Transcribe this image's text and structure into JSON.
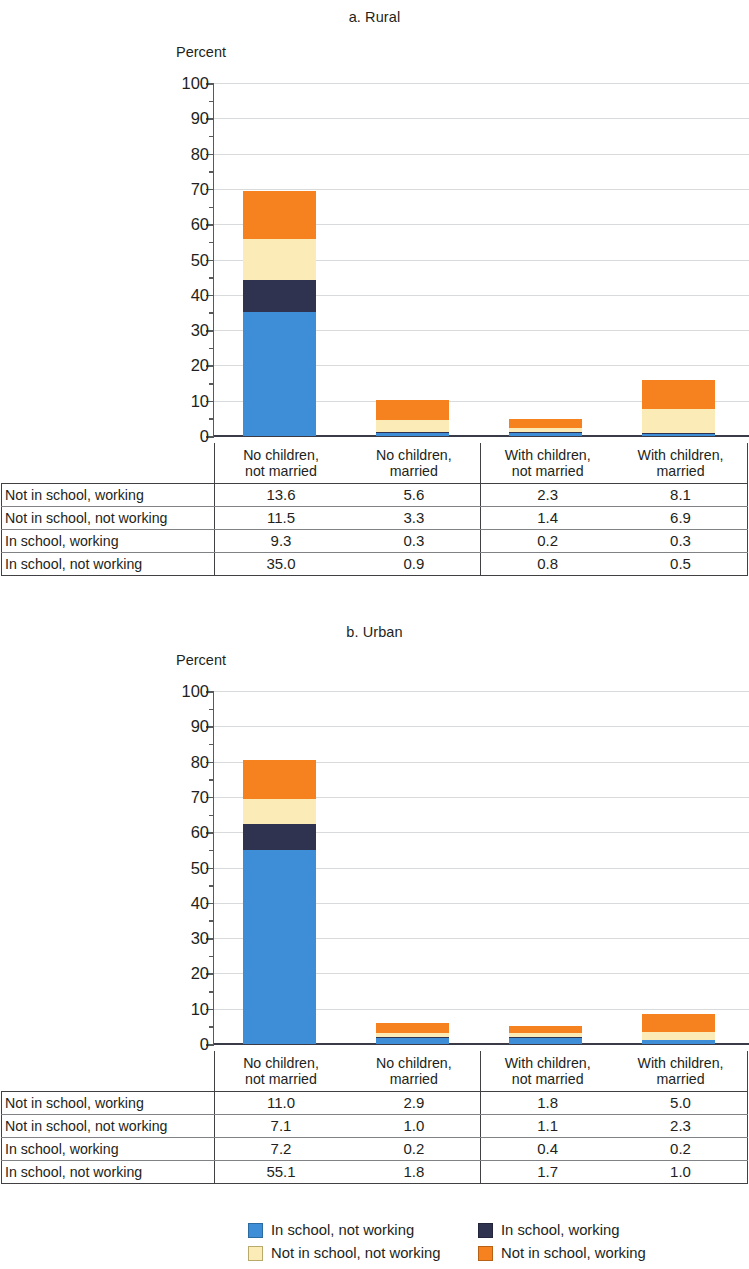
{
  "charts": [
    {
      "title": "a. Rural",
      "axis_unit": "Percent",
      "ylabel_top": "100"
    },
    {
      "title": "b. Urban",
      "axis_unit": "Percent",
      "ylabel_top": "100"
    }
  ],
  "yticks": [
    "100",
    "90",
    "80",
    "70",
    "60",
    "50",
    "40",
    "30",
    "20",
    "10",
    "0"
  ],
  "categories": [
    {
      "line1": "No children,",
      "line2": "not married"
    },
    {
      "line1": "No children,",
      "line2": "married"
    },
    {
      "line1": "With children,",
      "line2": "not married"
    },
    {
      "line1": "With children,",
      "line2": "married"
    }
  ],
  "row_labels": [
    "Not in school, working",
    "Not in school, not working",
    "In school, working",
    "In school, not working"
  ],
  "legend": [
    {
      "label": "In school, not working",
      "color": "#3d8ed6"
    },
    {
      "label": "In school, working",
      "color": "#2f3350"
    },
    {
      "label": "Not in school, not working",
      "color": "#fbebb7"
    },
    {
      "label": "Not in school, working",
      "color": "#f5821f"
    }
  ],
  "colors": {
    "in_school_not_working": "#3d8ed6",
    "in_school_working": "#2f3350",
    "not_in_school_not_working": "#fbebb7",
    "not_in_school_working": "#f5821f",
    "gridline": "#d9dadb",
    "axis": "#58595b",
    "text": "#231f20"
  },
  "chart_data": [
    {
      "type": "bar",
      "title": "a. Rural",
      "subtitle": "",
      "stacked": true,
      "xlabel": "",
      "ylabel": "Percent",
      "ylim": [
        0,
        100
      ],
      "ytick_interval": 10,
      "minor_tick_interval": 5,
      "grid": true,
      "legend_position": "bottom",
      "categories": [
        "No children, not married",
        "No children, married",
        "With children, not married",
        "With children, married"
      ],
      "series": [
        {
          "name": "In school, not working",
          "values": [
            35.0,
            0.9,
            0.8,
            0.5
          ],
          "color": "#3d8ed6"
        },
        {
          "name": "In school, working",
          "values": [
            9.3,
            0.3,
            0.2,
            0.3
          ],
          "color": "#2f3350"
        },
        {
          "name": "Not in school, not working",
          "values": [
            11.5,
            3.3,
            1.4,
            6.9
          ],
          "color": "#fbebb7"
        },
        {
          "name": "Not in school, working",
          "values": [
            13.6,
            5.6,
            2.3,
            8.1
          ],
          "color": "#f5821f"
        }
      ],
      "totals": [
        69.4,
        10.1,
        4.7,
        15.8
      ]
    },
    {
      "type": "bar",
      "title": "b. Urban",
      "subtitle": "",
      "stacked": true,
      "xlabel": "",
      "ylabel": "Percent",
      "ylim": [
        0,
        100
      ],
      "ytick_interval": 10,
      "minor_tick_interval": 5,
      "grid": true,
      "legend_position": "bottom",
      "categories": [
        "No children, not married",
        "No children, married",
        "With children, not married",
        "With children, married"
      ],
      "series": [
        {
          "name": "In school, not working",
          "values": [
            55.1,
            1.8,
            1.7,
            1.0
          ],
          "color": "#3d8ed6"
        },
        {
          "name": "In school, working",
          "values": [
            7.2,
            0.2,
            0.4,
            0.2
          ],
          "color": "#2f3350"
        },
        {
          "name": "Not in school, not working",
          "values": [
            7.1,
            1.0,
            1.1,
            2.3
          ],
          "color": "#fbebb7"
        },
        {
          "name": "Not in school, working",
          "values": [
            11.0,
            2.9,
            1.8,
            5.0
          ],
          "color": "#f5821f"
        }
      ],
      "totals": [
        80.4,
        5.9,
        5.0,
        8.5
      ]
    }
  ],
  "tables": [
    {
      "header_row_label": "",
      "rows": [
        {
          "label": "Not in school, working",
          "values": [
            "13.6",
            "5.6",
            "2.3",
            "8.1"
          ]
        },
        {
          "label": "Not in school, not working",
          "values": [
            "11.5",
            "3.3",
            "1.4",
            "6.9"
          ]
        },
        {
          "label": "In school, working",
          "values": [
            "9.3",
            "0.3",
            "0.2",
            "0.3"
          ]
        },
        {
          "label": "In school, not working",
          "values": [
            "35.0",
            "0.9",
            "0.8",
            "0.5"
          ]
        }
      ]
    },
    {
      "header_row_label": "",
      "rows": [
        {
          "label": "Not in school, working",
          "values": [
            "11.0",
            "2.9",
            "1.8",
            "5.0"
          ]
        },
        {
          "label": "Not in school, not working",
          "values": [
            "7.1",
            "1.0",
            "1.1",
            "2.3"
          ]
        },
        {
          "label": "In school, working",
          "values": [
            "7.2",
            "0.2",
            "0.4",
            "0.2"
          ]
        },
        {
          "label": "In school, not working",
          "values": [
            "55.1",
            "1.8",
            "1.7",
            "1.0"
          ]
        }
      ]
    }
  ]
}
